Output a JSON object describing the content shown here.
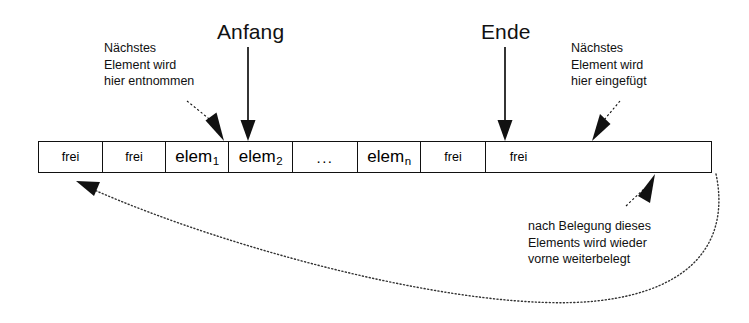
{
  "diagram": {
    "language": "de",
    "stroke_color": "#111111",
    "background_color": "#ffffff"
  },
  "pointer_labels": {
    "start": "Anfang",
    "end": "Ende"
  },
  "annotations": {
    "remove": {
      "line1": "Nächstes",
      "line2": "Element wird",
      "line3": "hier entnommen"
    },
    "insert": {
      "line1": "Nächstes",
      "line2": "Element wird",
      "line3": "hier eingefügt"
    },
    "wrap": {
      "line1": "nach Belegung dieses",
      "line2": "Elements wird wieder",
      "line3": "vorne weiterbelegt"
    }
  },
  "array": {
    "cell_count": 8,
    "cells": [
      {
        "label": "frei",
        "sub": "",
        "kind": "free"
      },
      {
        "label": "frei",
        "sub": "",
        "kind": "free"
      },
      {
        "label": "elem",
        "sub": "1",
        "kind": "element"
      },
      {
        "label": "elem",
        "sub": "2",
        "kind": "element"
      },
      {
        "label": "...",
        "sub": "",
        "kind": "ellipsis"
      },
      {
        "label": "elem",
        "sub": "n",
        "kind": "element"
      },
      {
        "label": "frei",
        "sub": "",
        "kind": "free"
      },
      {
        "label": "frei",
        "sub": "",
        "kind": "free"
      }
    ]
  },
  "icons": {
    "arrow_down_start": "arrow-down-icon",
    "arrow_down_end": "arrow-down-icon",
    "arrow_remove": "arrow-diagonal-icon",
    "arrow_insert": "arrow-diagonal-icon",
    "arrow_wrap_target": "arrow-diagonal-icon",
    "wrap_curve": "dotted-loop-arrow-icon"
  }
}
